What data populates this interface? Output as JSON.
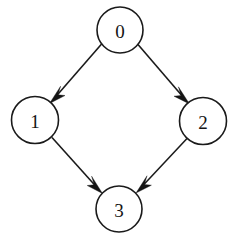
{
  "diagram": {
    "type": "directed-graph",
    "background_color": "#ffffff",
    "stroke_color": "#1a1a1a",
    "label_color": "#141414",
    "canvas": {
      "width": 237,
      "height": 240
    },
    "nodes": [
      {
        "id": "0",
        "label": "0",
        "cx": 120,
        "cy": 30,
        "r": 23
      },
      {
        "id": "1",
        "label": "1",
        "cx": 35,
        "cy": 120,
        "r": 23.5
      },
      {
        "id": "2",
        "label": "2",
        "cx": 203,
        "cy": 121,
        "r": 23.5
      },
      {
        "id": "3",
        "label": "3",
        "cx": 119,
        "cy": 209,
        "r": 23
      }
    ],
    "edges": [
      {
        "id": "edge-0-1",
        "from": "0",
        "to": "1",
        "label": "",
        "directed": true
      },
      {
        "id": "edge-0-2",
        "from": "0",
        "to": "2",
        "label": "",
        "directed": true
      },
      {
        "id": "edge-1-3",
        "from": "1",
        "to": "3",
        "label": "",
        "directed": true
      },
      {
        "id": "edge-2-3",
        "from": "2",
        "to": "3",
        "label": "",
        "directed": true
      }
    ]
  }
}
